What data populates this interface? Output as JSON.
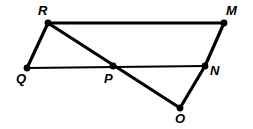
{
  "figure": {
    "type": "geometry-diagram",
    "width": 253,
    "height": 129,
    "background_color": "#ffffff",
    "stroke_color": "#000000",
    "thick_stroke_width": 3.2,
    "thin_stroke_width": 2.0,
    "vertex_dot_radius": 3.4,
    "points": [
      {
        "id": "R",
        "label": "R",
        "x": 48,
        "y": 23,
        "label_x": 38,
        "label_y": 4
      },
      {
        "id": "M",
        "label": "M",
        "x": 224,
        "y": 23,
        "label_x": 226,
        "label_y": 4
      },
      {
        "id": "Q",
        "label": "Q",
        "x": 27,
        "y": 68,
        "label_x": 16,
        "label_y": 72
      },
      {
        "id": "P",
        "label": "P",
        "x": 113,
        "y": 66,
        "label_x": 104,
        "label_y": 72
      },
      {
        "id": "N",
        "label": "N",
        "x": 205,
        "y": 66,
        "label_x": 210,
        "label_y": 64
      },
      {
        "id": "O",
        "label": "O",
        "x": 180,
        "y": 108,
        "label_x": 175,
        "label_y": 112
      }
    ],
    "segments": [
      {
        "name": "segment-RM",
        "from": "R",
        "to": "M",
        "weight": "thick"
      },
      {
        "name": "segment-RQ",
        "from": "R",
        "to": "Q",
        "weight": "thick"
      },
      {
        "name": "segment-RO",
        "from": "R",
        "to": "O",
        "weight": "thick"
      },
      {
        "name": "segment-MN",
        "from": "M",
        "to": "N",
        "weight": "thick"
      },
      {
        "name": "segment-NO",
        "from": "N",
        "to": "O",
        "weight": "thick"
      },
      {
        "name": "segment-QN",
        "from": "Q",
        "to": "N",
        "weight": "thin"
      }
    ]
  }
}
